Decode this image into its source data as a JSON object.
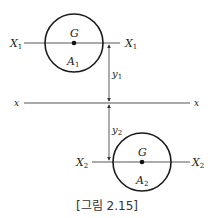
{
  "figure": {
    "caption": "[그림 2.15]",
    "axis": {
      "label_left": "x",
      "label_right": "x"
    },
    "shape1": {
      "area_label": "A",
      "area_sub": "1",
      "centroid_label": "G",
      "axis_label": "X",
      "axis_sub": "1"
    },
    "shape2": {
      "area_label": "A",
      "area_sub": "2",
      "centroid_label": "G",
      "axis_label": "X",
      "axis_sub": "2"
    },
    "dimensions": {
      "y1_label": "y",
      "y1_sub": "1",
      "y2_label": "y",
      "y2_sub": "2"
    },
    "colors": {
      "stroke": "#1a1a1a",
      "thin": "#444444"
    }
  }
}
